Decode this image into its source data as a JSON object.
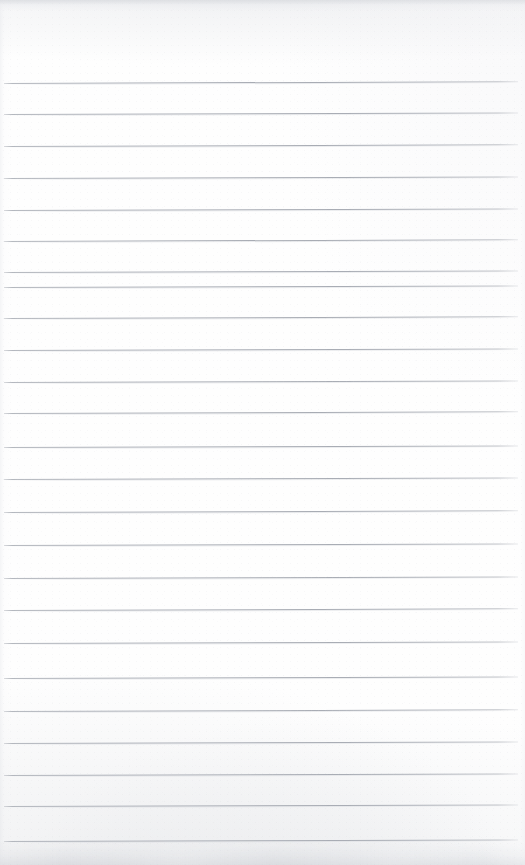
{
  "document": {
    "kind": "scanned-lined-paper",
    "title": "Blank ruled notepad page",
    "page_width": 525,
    "page_height": 865,
    "has_text": false,
    "body_text": "",
    "margin_text": "",
    "header_text": "",
    "footer_text": ""
  },
  "colors": {
    "paper": "#fefefe",
    "rule": "#aaaeb6",
    "rule_soft": "#d2d4d9",
    "edge_shade": "#d8dade",
    "bottom_smudge": "#c6c8ce"
  },
  "ruling": {
    "style": "wide-ruled-horizontal",
    "count": 25,
    "first_line_y": 83,
    "spacing": 31.6,
    "left_x": 4,
    "right_x": 518,
    "thickness": 1,
    "tilt_deg": -0.18,
    "lines": [
      {
        "index": 1,
        "y": 83,
        "left": 4,
        "width": 514,
        "tilt": -0.2
      },
      {
        "index": 2,
        "y": 114,
        "left": 4,
        "width": 514,
        "tilt": -0.18
      },
      {
        "index": 3,
        "y": 146,
        "left": 4,
        "width": 514,
        "tilt": -0.19
      },
      {
        "index": 4,
        "y": 178,
        "left": 4,
        "width": 514,
        "tilt": -0.17
      },
      {
        "index": 5,
        "y": 210,
        "left": 4,
        "width": 514,
        "tilt": -0.18
      },
      {
        "index": 6,
        "y": 241,
        "left": 4,
        "width": 514,
        "tilt": -0.2
      },
      {
        "index": 7,
        "y": 272,
        "left": 4,
        "width": 514,
        "tilt": -0.18
      },
      {
        "index": 8,
        "y": 287,
        "left": 4,
        "width": 514,
        "tilt": -0.17
      },
      {
        "index": 9,
        "y": 318,
        "left": 4,
        "width": 514,
        "tilt": -0.19
      },
      {
        "index": 10,
        "y": 350,
        "left": 4,
        "width": 514,
        "tilt": -0.18
      },
      {
        "index": 11,
        "y": 382,
        "left": 4,
        "width": 514,
        "tilt": -0.18
      },
      {
        "index": 12,
        "y": 413,
        "left": 4,
        "width": 514,
        "tilt": -0.19
      },
      {
        "index": 13,
        "y": 447,
        "left": 4,
        "width": 514,
        "tilt": -0.17
      },
      {
        "index": 14,
        "y": 479,
        "left": 4,
        "width": 514,
        "tilt": -0.18
      },
      {
        "index": 15,
        "y": 512,
        "left": 4,
        "width": 514,
        "tilt": -0.19
      },
      {
        "index": 16,
        "y": 545,
        "left": 4,
        "width": 514,
        "tilt": -0.18
      },
      {
        "index": 17,
        "y": 578,
        "left": 4,
        "width": 514,
        "tilt": -0.17
      },
      {
        "index": 18,
        "y": 610,
        "left": 4,
        "width": 514,
        "tilt": -0.19
      },
      {
        "index": 19,
        "y": 643,
        "left": 4,
        "width": 514,
        "tilt": -0.18
      },
      {
        "index": 20,
        "y": 678,
        "left": 4,
        "width": 514,
        "tilt": -0.18
      },
      {
        "index": 21,
        "y": 711,
        "left": 4,
        "width": 514,
        "tilt": -0.19
      },
      {
        "index": 22,
        "y": 743,
        "left": 4,
        "width": 514,
        "tilt": -0.18
      },
      {
        "index": 23,
        "y": 775,
        "left": 4,
        "width": 514,
        "tilt": -0.18
      },
      {
        "index": 24,
        "y": 806,
        "left": 4,
        "width": 514,
        "tilt": -0.17
      },
      {
        "index": 25,
        "y": 841,
        "left": 4,
        "width": 514,
        "tilt": -0.18
      }
    ]
  }
}
